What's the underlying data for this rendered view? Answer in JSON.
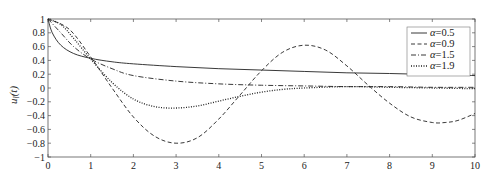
{
  "chart_data": {
    "type": "line",
    "title": "",
    "xlabel": "t",
    "ylabel": "u_l(t)",
    "xlim": [
      0,
      10
    ],
    "ylim": [
      -1,
      1
    ],
    "xticks": [
      "0",
      "1",
      "2",
      "3",
      "4",
      "5",
      "6",
      "7",
      "8",
      "9",
      "10"
    ],
    "yticks": [
      "1",
      "0.8",
      "0.6",
      "0.4",
      "0.2",
      "0",
      "-0.2",
      "-0.4",
      "-0.6",
      "-0.8",
      "-1"
    ],
    "grid": false,
    "legend_position": "upper right",
    "series": [
      {
        "name": "α=0.5",
        "style": "solid",
        "x": [
          0,
          0.1,
          0.3,
          0.6,
          1,
          1.5,
          2,
          3,
          4,
          5,
          6,
          7,
          8,
          9,
          10
        ],
        "y": [
          1,
          0.8,
          0.62,
          0.5,
          0.43,
          0.38,
          0.35,
          0.31,
          0.28,
          0.26,
          0.24,
          0.22,
          0.21,
          0.195,
          0.18
        ]
      },
      {
        "name": "α=0.9",
        "style": "dashed",
        "x": [
          0,
          0.5,
          1,
          1.5,
          2,
          2.5,
          3,
          3.5,
          4,
          4.5,
          5,
          5.5,
          6,
          6.5,
          7,
          7.5,
          8,
          8.5,
          9,
          9.3,
          9.6,
          10
        ],
        "y": [
          1,
          0.85,
          0.45,
          0.0,
          -0.42,
          -0.7,
          -0.8,
          -0.72,
          -0.45,
          -0.1,
          0.25,
          0.52,
          0.62,
          0.55,
          0.32,
          0.04,
          -0.22,
          -0.42,
          -0.5,
          -0.5,
          -0.47,
          -0.37
        ]
      },
      {
        "name": "α=1.5",
        "style": "dashdot",
        "x": [
          0,
          0.3,
          0.6,
          1,
          1.5,
          2,
          3,
          4,
          5,
          6,
          7,
          8,
          9,
          10
        ],
        "y": [
          1,
          0.8,
          0.6,
          0.42,
          0.28,
          0.18,
          0.1,
          0.06,
          0.04,
          0.03,
          0.02,
          0.02,
          0.01,
          0.01
        ]
      },
      {
        "name": "α=1.9",
        "style": "dotted",
        "x": [
          0,
          0.3,
          0.6,
          1,
          1.5,
          2,
          2.5,
          3,
          3.5,
          4,
          4.5,
          5,
          5.5,
          6,
          7,
          8,
          9,
          10
        ],
        "y": [
          1,
          0.92,
          0.72,
          0.42,
          0.08,
          -0.16,
          -0.27,
          -0.29,
          -0.26,
          -0.19,
          -0.12,
          -0.06,
          -0.02,
          0.0,
          0.02,
          0.01,
          0.0,
          -0.01
        ]
      }
    ]
  },
  "legend": {
    "items": [
      {
        "label": "α=0.5",
        "style": "solid"
      },
      {
        "label": "α=0.9",
        "style": "dashed"
      },
      {
        "label": "α=1.5",
        "style": "dashdot"
      },
      {
        "label": "α=1.9",
        "style": "dotted"
      }
    ]
  },
  "axis": {
    "ylabel": "u_l(t)"
  }
}
